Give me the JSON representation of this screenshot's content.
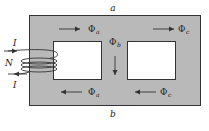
{
  "diagram": {
    "type": "magnetic-circuit",
    "colors": {
      "core_fill": "#b9b9b9",
      "core_stroke": "#333333",
      "window_fill": "#ffffff",
      "ink": "#222222"
    },
    "labels": {
      "top_node": "a",
      "bottom_node": "b",
      "current_in": "I",
      "current_out": "I",
      "turns": "N"
    },
    "fluxes": [
      {
        "id": "phi-a-top",
        "symbol": "Φ",
        "subscript": "a",
        "direction": "right"
      },
      {
        "id": "phi-c-top",
        "symbol": "Φ",
        "subscript": "c",
        "direction": "right"
      },
      {
        "id": "phi-b-center",
        "symbol": "Φ",
        "subscript": "b",
        "direction": "down"
      },
      {
        "id": "phi-a-bottom",
        "symbol": "Φ",
        "subscript": "a",
        "direction": "left"
      },
      {
        "id": "phi-c-bottom",
        "symbol": "Φ",
        "subscript": "c",
        "direction": "left"
      }
    ]
  }
}
